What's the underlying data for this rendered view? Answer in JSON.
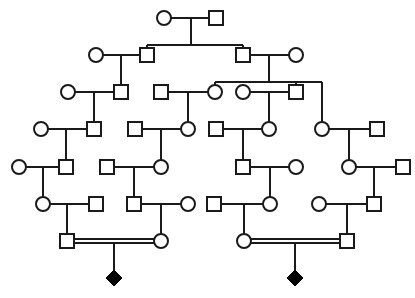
{
  "diagram": {
    "type": "pedigree",
    "colors": {
      "line": "#1a1a1a",
      "affected": "#000000",
      "background": "#ffffff"
    },
    "symbol_size": 14,
    "nodes": [
      {
        "id": "I1",
        "shape": "circle",
        "x": 164,
        "y": 18
      },
      {
        "id": "I2",
        "shape": "square",
        "x": 216,
        "y": 18
      },
      {
        "id": "II1",
        "shape": "circle",
        "x": 96,
        "y": 55
      },
      {
        "id": "II2",
        "shape": "square",
        "x": 147,
        "y": 55
      },
      {
        "id": "II3",
        "shape": "square",
        "x": 243,
        "y": 55
      },
      {
        "id": "II4",
        "shape": "circle",
        "x": 296,
        "y": 55
      },
      {
        "id": "III1",
        "shape": "circle",
        "x": 68,
        "y": 92
      },
      {
        "id": "III2",
        "shape": "square",
        "x": 121,
        "y": 92
      },
      {
        "id": "III3",
        "shape": "square",
        "x": 161,
        "y": 92
      },
      {
        "id": "III4",
        "shape": "circle",
        "x": 215,
        "y": 92
      },
      {
        "id": "III5",
        "shape": "circle",
        "x": 243,
        "y": 92
      },
      {
        "id": "III6",
        "shape": "square",
        "x": 296,
        "y": 92
      },
      {
        "id": "IV1",
        "shape": "circle",
        "x": 41,
        "y": 129
      },
      {
        "id": "IV2",
        "shape": "square",
        "x": 94,
        "y": 129
      },
      {
        "id": "IV3",
        "shape": "square",
        "x": 135,
        "y": 129
      },
      {
        "id": "IV4",
        "shape": "circle",
        "x": 188,
        "y": 129
      },
      {
        "id": "IV5",
        "shape": "square",
        "x": 216,
        "y": 129
      },
      {
        "id": "IV6",
        "shape": "circle",
        "x": 269,
        "y": 129
      },
      {
        "id": "IV7",
        "shape": "circle",
        "x": 322,
        "y": 129
      },
      {
        "id": "IV8",
        "shape": "square",
        "x": 377,
        "y": 129
      },
      {
        "id": "V1",
        "shape": "circle",
        "x": 19,
        "y": 167
      },
      {
        "id": "V2",
        "shape": "square",
        "x": 66,
        "y": 167
      },
      {
        "id": "V3",
        "shape": "square",
        "x": 107,
        "y": 167
      },
      {
        "id": "V4",
        "shape": "circle",
        "x": 161,
        "y": 167
      },
      {
        "id": "V5",
        "shape": "square",
        "x": 243,
        "y": 167
      },
      {
        "id": "V6",
        "shape": "circle",
        "x": 296,
        "y": 167
      },
      {
        "id": "V7",
        "shape": "circle",
        "x": 349,
        "y": 167
      },
      {
        "id": "V8",
        "shape": "square",
        "x": 403,
        "y": 167
      },
      {
        "id": "VI1",
        "shape": "circle",
        "x": 43,
        "y": 204
      },
      {
        "id": "VI2",
        "shape": "square",
        "x": 96,
        "y": 204
      },
      {
        "id": "VI3",
        "shape": "square",
        "x": 134,
        "y": 204
      },
      {
        "id": "VI4",
        "shape": "circle",
        "x": 188,
        "y": 204
      },
      {
        "id": "VI5",
        "shape": "square",
        "x": 214,
        "y": 204
      },
      {
        "id": "VI6",
        "shape": "circle",
        "x": 270,
        "y": 204
      },
      {
        "id": "VI7",
        "shape": "circle",
        "x": 319,
        "y": 204
      },
      {
        "id": "VI8",
        "shape": "square",
        "x": 374,
        "y": 204
      },
      {
        "id": "VII1",
        "shape": "square",
        "x": 67,
        "y": 241
      },
      {
        "id": "VII2",
        "shape": "circle",
        "x": 161,
        "y": 241
      },
      {
        "id": "VII3",
        "shape": "circle",
        "x": 244,
        "y": 241
      },
      {
        "id": "VII4",
        "shape": "square",
        "x": 347,
        "y": 241
      },
      {
        "id": "VIII1",
        "shape": "diamond",
        "affected": true,
        "x": 114,
        "y": 278
      },
      {
        "id": "VIII2",
        "shape": "diamond",
        "affected": true,
        "x": 295,
        "y": 278
      }
    ],
    "lines": [
      {
        "kind": "mating",
        "pts": [
          [
            171,
            18
          ],
          [
            209,
            18
          ]
        ]
      },
      {
        "kind": "descent",
        "pts": [
          [
            191,
            18
          ],
          [
            191,
            45
          ]
        ]
      },
      {
        "kind": "sibship",
        "pts": [
          [
            147,
            45
          ],
          [
            243,
            45
          ]
        ]
      },
      {
        "kind": "descent",
        "pts": [
          [
            147,
            45
          ],
          [
            147,
            48
          ]
        ]
      },
      {
        "kind": "descent",
        "pts": [
          [
            243,
            45
          ],
          [
            243,
            48
          ]
        ]
      },
      {
        "kind": "mating",
        "pts": [
          [
            103,
            55
          ],
          [
            140,
            55
          ]
        ]
      },
      {
        "kind": "descent",
        "pts": [
          [
            121,
            55
          ],
          [
            121,
            85
          ]
        ]
      },
      {
        "kind": "mating",
        "pts": [
          [
            250,
            55
          ],
          [
            289,
            55
          ]
        ]
      },
      {
        "kind": "descent",
        "pts": [
          [
            269,
            55
          ],
          [
            269,
            82
          ]
        ]
      },
      {
        "kind": "sibship",
        "pts": [
          [
            215,
            82
          ],
          [
            322,
            82
          ]
        ]
      },
      {
        "kind": "descent",
        "pts": [
          [
            215,
            82
          ],
          [
            215,
            85
          ]
        ]
      },
      {
        "kind": "descent",
        "pts": [
          [
            296,
            82
          ],
          [
            296,
            85
          ]
        ]
      },
      {
        "kind": "descent",
        "pts": [
          [
            322,
            82
          ],
          [
            322,
            122
          ]
        ]
      },
      {
        "kind": "mating",
        "pts": [
          [
            75,
            92
          ],
          [
            114,
            92
          ]
        ]
      },
      {
        "kind": "descent",
        "pts": [
          [
            94,
            92
          ],
          [
            94,
            122
          ]
        ]
      },
      {
        "kind": "mating",
        "pts": [
          [
            168,
            92
          ],
          [
            208,
            92
          ]
        ]
      },
      {
        "kind": "descent",
        "pts": [
          [
            188,
            92
          ],
          [
            188,
            122
          ]
        ]
      },
      {
        "kind": "mating",
        "pts": [
          [
            250,
            92
          ],
          [
            289,
            92
          ]
        ]
      },
      {
        "kind": "descent",
        "pts": [
          [
            269,
            92
          ],
          [
            269,
            122
          ]
        ]
      },
      {
        "kind": "mating",
        "pts": [
          [
            48,
            129
          ],
          [
            87,
            129
          ]
        ]
      },
      {
        "kind": "descent",
        "pts": [
          [
            66,
            129
          ],
          [
            66,
            160
          ]
        ]
      },
      {
        "kind": "mating",
        "pts": [
          [
            142,
            129
          ],
          [
            181,
            129
          ]
        ]
      },
      {
        "kind": "descent",
        "pts": [
          [
            161,
            129
          ],
          [
            161,
            160
          ]
        ]
      },
      {
        "kind": "mating",
        "pts": [
          [
            223,
            129
          ],
          [
            262,
            129
          ]
        ]
      },
      {
        "kind": "descent",
        "pts": [
          [
            243,
            129
          ],
          [
            243,
            160
          ]
        ]
      },
      {
        "kind": "mating",
        "pts": [
          [
            329,
            129
          ],
          [
            370,
            129
          ]
        ]
      },
      {
        "kind": "descent",
        "pts": [
          [
            349,
            129
          ],
          [
            349,
            160
          ]
        ]
      },
      {
        "kind": "mating",
        "pts": [
          [
            26,
            167
          ],
          [
            59,
            167
          ]
        ]
      },
      {
        "kind": "descent",
        "pts": [
          [
            43,
            167
          ],
          [
            43,
            197
          ]
        ]
      },
      {
        "kind": "mating",
        "pts": [
          [
            114,
            167
          ],
          [
            154,
            167
          ]
        ]
      },
      {
        "kind": "descent",
        "pts": [
          [
            134,
            167
          ],
          [
            134,
            197
          ]
        ]
      },
      {
        "kind": "mating",
        "pts": [
          [
            250,
            167
          ],
          [
            289,
            167
          ]
        ]
      },
      {
        "kind": "descent",
        "pts": [
          [
            270,
            167
          ],
          [
            270,
            197
          ]
        ]
      },
      {
        "kind": "mating",
        "pts": [
          [
            356,
            167
          ],
          [
            396,
            167
          ]
        ]
      },
      {
        "kind": "descent",
        "pts": [
          [
            374,
            167
          ],
          [
            374,
            197
          ]
        ]
      },
      {
        "kind": "mating",
        "pts": [
          [
            50,
            204
          ],
          [
            89,
            204
          ]
        ]
      },
      {
        "kind": "descent",
        "pts": [
          [
            67,
            204
          ],
          [
            67,
            234
          ]
        ]
      },
      {
        "kind": "mating",
        "pts": [
          [
            141,
            204
          ],
          [
            181,
            204
          ]
        ]
      },
      {
        "kind": "descent",
        "pts": [
          [
            161,
            204
          ],
          [
            161,
            234
          ]
        ]
      },
      {
        "kind": "mating",
        "pts": [
          [
            221,
            204
          ],
          [
            263,
            204
          ]
        ]
      },
      {
        "kind": "descent",
        "pts": [
          [
            244,
            204
          ],
          [
            244,
            234
          ]
        ]
      },
      {
        "kind": "mating",
        "pts": [
          [
            326,
            204
          ],
          [
            367,
            204
          ]
        ]
      },
      {
        "kind": "descent",
        "pts": [
          [
            347,
            204
          ],
          [
            347,
            234
          ]
        ]
      },
      {
        "kind": "consanguineous",
        "pts": [
          [
            74,
            239
          ],
          [
            154,
            239
          ]
        ]
      },
      {
        "kind": "consanguineous",
        "pts": [
          [
            74,
            243
          ],
          [
            154,
            243
          ]
        ]
      },
      {
        "kind": "descent",
        "pts": [
          [
            114,
            243
          ],
          [
            114,
            271
          ]
        ]
      },
      {
        "kind": "consanguineous",
        "pts": [
          [
            251,
            239
          ],
          [
            340,
            239
          ]
        ]
      },
      {
        "kind": "consanguineous",
        "pts": [
          [
            251,
            243
          ],
          [
            340,
            243
          ]
        ]
      },
      {
        "kind": "descent",
        "pts": [
          [
            295,
            243
          ],
          [
            295,
            271
          ]
        ]
      }
    ]
  }
}
